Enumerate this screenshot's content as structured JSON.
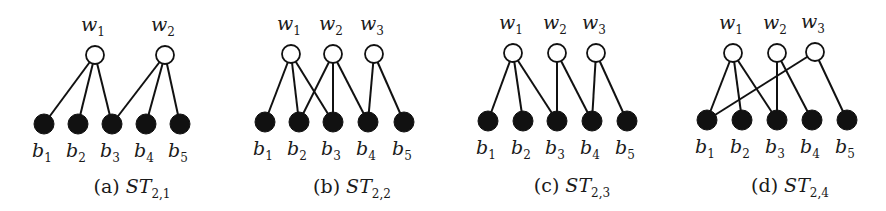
{
  "colors": {
    "ink": "#111111",
    "background": "#ffffff",
    "white_node_fill": "#ffffff"
  },
  "panels": [
    {
      "id": "a",
      "caption": {
        "prefix": "(a)",
        "name": "ST",
        "subscript": "2,1",
        "x": 132,
        "y": 193
      },
      "white_nodes": [
        {
          "label": "w",
          "sub": "1",
          "x": 95,
          "y": 55
        },
        {
          "label": "w",
          "sub": "2",
          "x": 165,
          "y": 55
        }
      ],
      "black_nodes": [
        {
          "label": "b",
          "sub": "1",
          "x": 44,
          "y": 124
        },
        {
          "label": "b",
          "sub": "2",
          "x": 78,
          "y": 124
        },
        {
          "label": "b",
          "sub": "3",
          "x": 112,
          "y": 124
        },
        {
          "label": "b",
          "sub": "4",
          "x": 146,
          "y": 124
        },
        {
          "label": "b",
          "sub": "5",
          "x": 180,
          "y": 124
        }
      ],
      "edges": [
        [
          0,
          0
        ],
        [
          0,
          1
        ],
        [
          0,
          2
        ],
        [
          1,
          2
        ],
        [
          1,
          3
        ],
        [
          1,
          4
        ]
      ]
    },
    {
      "id": "b",
      "caption": {
        "prefix": "(b)",
        "name": "ST",
        "subscript": "2,2",
        "x": 352,
        "y": 193
      },
      "white_nodes": [
        {
          "label": "w",
          "sub": "1",
          "x": 291,
          "y": 54
        },
        {
          "label": "w",
          "sub": "2",
          "x": 333,
          "y": 54
        },
        {
          "label": "w",
          "sub": "3",
          "x": 374,
          "y": 54
        }
      ],
      "black_nodes": [
        {
          "label": "b",
          "sub": "1",
          "x": 265,
          "y": 122
        },
        {
          "label": "b",
          "sub": "2",
          "x": 299,
          "y": 122
        },
        {
          "label": "b",
          "sub": "3",
          "x": 333,
          "y": 122
        },
        {
          "label": "b",
          "sub": "4",
          "x": 368,
          "y": 122
        },
        {
          "label": "b",
          "sub": "5",
          "x": 404,
          "y": 122
        }
      ],
      "edges": [
        [
          0,
          0
        ],
        [
          0,
          1
        ],
        [
          0,
          2
        ],
        [
          1,
          1
        ],
        [
          1,
          2
        ],
        [
          1,
          3
        ],
        [
          2,
          3
        ],
        [
          2,
          4
        ]
      ]
    },
    {
      "id": "c",
      "caption": {
        "prefix": "(c)",
        "name": "ST",
        "subscript": "2,3",
        "x": 572,
        "y": 192
      },
      "white_nodes": [
        {
          "label": "w",
          "sub": "1",
          "x": 513,
          "y": 53
        },
        {
          "label": "w",
          "sub": "2",
          "x": 557,
          "y": 53
        },
        {
          "label": "w",
          "sub": "3",
          "x": 596,
          "y": 53
        }
      ],
      "black_nodes": [
        {
          "label": "b",
          "sub": "1",
          "x": 488,
          "y": 121
        },
        {
          "label": "b",
          "sub": "2",
          "x": 523,
          "y": 121
        },
        {
          "label": "b",
          "sub": "3",
          "x": 557,
          "y": 121
        },
        {
          "label": "b",
          "sub": "4",
          "x": 592,
          "y": 121
        },
        {
          "label": "b",
          "sub": "5",
          "x": 627,
          "y": 121
        }
      ],
      "edges": [
        [
          0,
          0
        ],
        [
          0,
          1
        ],
        [
          0,
          2
        ],
        [
          1,
          2
        ],
        [
          1,
          3
        ],
        [
          2,
          3
        ],
        [
          2,
          4
        ]
      ]
    },
    {
      "id": "d",
      "caption": {
        "prefix": "(d)",
        "name": "ST",
        "subscript": "2,4",
        "x": 790,
        "y": 192
      },
      "white_nodes": [
        {
          "label": "w",
          "sub": "1",
          "x": 733,
          "y": 53
        },
        {
          "label": "w",
          "sub": "2",
          "x": 777,
          "y": 53
        },
        {
          "label": "w",
          "sub": "3",
          "x": 815,
          "y": 52
        }
      ],
      "black_nodes": [
        {
          "label": "b",
          "sub": "1",
          "x": 707,
          "y": 120
        },
        {
          "label": "b",
          "sub": "2",
          "x": 742,
          "y": 120
        },
        {
          "label": "b",
          "sub": "3",
          "x": 777,
          "y": 120
        },
        {
          "label": "b",
          "sub": "4",
          "x": 812,
          "y": 120
        },
        {
          "label": "b",
          "sub": "5",
          "x": 847,
          "y": 120
        }
      ],
      "edges": [
        [
          0,
          0
        ],
        [
          0,
          1
        ],
        [
          0,
          2
        ],
        [
          1,
          2
        ],
        [
          1,
          3
        ],
        [
          2,
          0
        ],
        [
          2,
          4
        ]
      ]
    }
  ],
  "layout": {
    "white_radius": 9,
    "black_radius": 10,
    "w_label_dy": -24,
    "b_label_dy": 33
  }
}
